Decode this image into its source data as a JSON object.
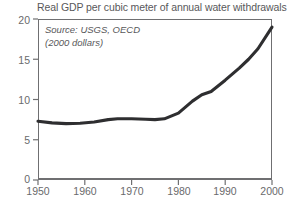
{
  "chart_data": {
    "type": "line",
    "title": "Real GDP per cubic meter of annual water withdrawals",
    "xlabel": "",
    "ylabel": "",
    "xlim": [
      1950,
      2000
    ],
    "ylim": [
      0,
      20
    ],
    "grid": false,
    "legend": "none",
    "annotations": [
      "Source: USGS, OECD",
      "(2000 dollars)"
    ],
    "xticks": [
      "1950",
      "1960",
      "1970",
      "1980",
      "1990",
      "2000"
    ],
    "yticks": [
      "0",
      "5",
      "10",
      "15",
      "20"
    ],
    "series": [
      {
        "name": "Real GDP per cubic meter of annual water withdrawals",
        "color": "#2e2e30",
        "x": [
          1950,
          1953,
          1956,
          1959,
          1962,
          1965,
          1967,
          1970,
          1973,
          1975,
          1977,
          1980,
          1983,
          1985,
          1987,
          1990,
          1993,
          1995,
          1997,
          2000
        ],
        "values": [
          7.3,
          7.1,
          7.0,
          7.05,
          7.2,
          7.5,
          7.6,
          7.6,
          7.55,
          7.5,
          7.6,
          8.3,
          9.8,
          10.6,
          11.0,
          12.4,
          13.9,
          15.0,
          16.3,
          19.0
        ]
      }
    ]
  },
  "axis": {
    "y_label_0": "0",
    "y_label_5": "5",
    "y_label_10": "10",
    "y_label_15": "15",
    "y_label_20": "20",
    "x_label_1950": "1950",
    "x_label_1960": "1960",
    "x_label_1970": "1970",
    "x_label_1980": "1980",
    "x_label_1990": "1990",
    "x_label_2000": "2000"
  }
}
